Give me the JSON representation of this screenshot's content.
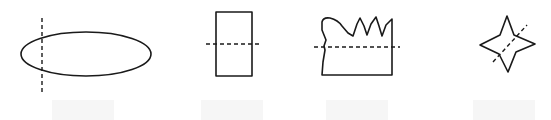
{
  "figure": {
    "colors": {
      "stroke": "#1a1a1a",
      "background": "#ffffff",
      "label_box": "#f6f6f6"
    },
    "items": [
      {
        "shape": "ellipse",
        "line": "vertical dashed line near left end",
        "label": ""
      },
      {
        "shape": "rectangle",
        "line": "horizontal dashed line through middle",
        "label": ""
      },
      {
        "shape": "irregular jagged-top shape",
        "line": "horizontal dashed line",
        "label": ""
      },
      {
        "shape": "four-pointed star",
        "line": "diagonal dashed line",
        "label": ""
      }
    ]
  }
}
